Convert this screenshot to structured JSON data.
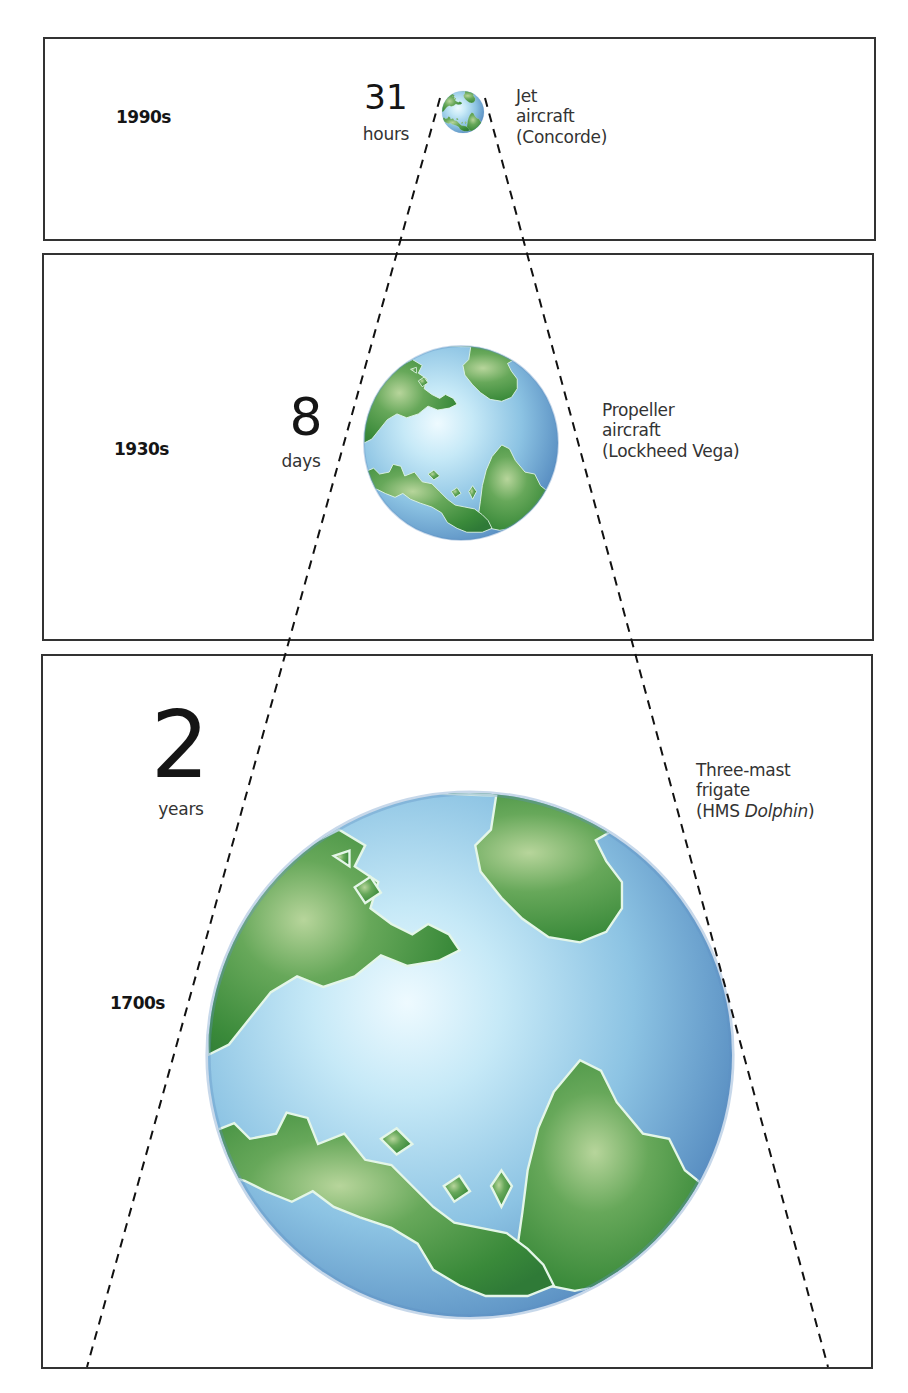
{
  "diagram": {
    "type": "shrinking-world comparison",
    "panels": [
      {
        "era": "1990s",
        "duration_value": "31",
        "duration_unit": "hours",
        "vehicle_line1": "Jet",
        "vehicle_line2": "aircraft",
        "vehicle_line3": "(Concorde)",
        "globe_size": "small"
      },
      {
        "era": "1930s",
        "duration_value": "8",
        "duration_unit": "days",
        "vehicle_line1": "Propeller",
        "vehicle_line2": "aircraft",
        "vehicle_line3": "(Lockheed Vega)",
        "globe_size": "medium"
      },
      {
        "era": "1700s",
        "duration_value": "2",
        "duration_unit": "years",
        "vehicle_line1": "Three-mast",
        "vehicle_line2": "frigate",
        "vehicle_line3_prefix": "(HMS ",
        "vehicle_line3_italic": "Dolphin",
        "vehicle_line3_suffix": ")",
        "globe_size": "large"
      }
    ],
    "colors": {
      "land": "#3f8f3a",
      "land_light": "#8bb870",
      "ocean_light": "#d8f2fb",
      "ocean_mid": "#8cc3e3",
      "ocean_dark": "#4f86bd",
      "border": "#333333",
      "dash": "#111111"
    }
  }
}
